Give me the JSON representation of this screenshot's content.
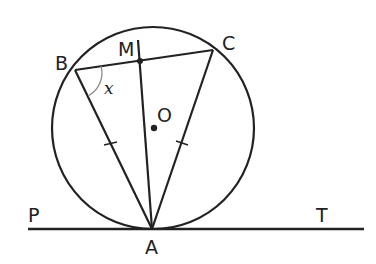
{
  "diagram": {
    "points": {
      "B": "B",
      "M": "M",
      "C": "C",
      "O": "O",
      "P": "P",
      "T": "T",
      "A": "A"
    },
    "angle_label": "x",
    "stroke_color": "#222222",
    "angle_arc_color": "#888888",
    "elements": [
      "circle with center O",
      "tangent line PT at A",
      "chord BC",
      "segments AB, AC, AM",
      "tick marks AB = AC",
      "angle x at B"
    ]
  }
}
